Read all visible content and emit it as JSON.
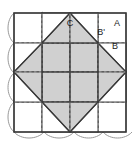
{
  "diagram": {
    "canvas": {
      "width": 138,
      "height": 146
    },
    "colors": {
      "background": "#ffffff",
      "patch_fill": "#d0d0d0",
      "patch_light": "#ffffff",
      "outline": "#3a3a3a",
      "seam_line": "#b4b4b4",
      "arc_line": "#9a9a9a",
      "label_text": "#1a1a1a"
    },
    "block": {
      "x": 14,
      "y": 13,
      "width": 112,
      "height": 119,
      "grid_columns": 4,
      "grid_rows": 4
    },
    "labels": [
      {
        "text": "C",
        "x": 70,
        "y": 24
      },
      {
        "text": "B'",
        "x": 101,
        "y": 33
      },
      {
        "text": "A",
        "x": 117,
        "y": 24
      },
      {
        "text": "B",
        "x": 115,
        "y": 47
      }
    ],
    "legend": {
      "piece_a": "A",
      "piece_b": "B",
      "piece_b_prime": "B'",
      "piece_c": "C"
    }
  }
}
